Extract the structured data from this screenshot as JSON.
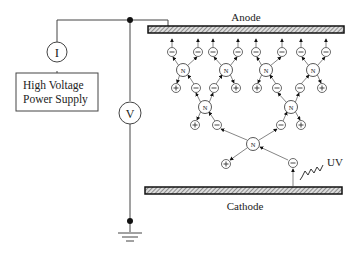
{
  "diagram": {
    "labels": {
      "anode": "Anode",
      "cathode": "Cathode",
      "uv": "UV",
      "power_supply_line1": "High Voltage",
      "power_supply_line2": "Power Supply",
      "ammeter": "I",
      "voltmeter": "V",
      "neutral": "N",
      "negative": "−",
      "positive": "+"
    },
    "colors": {
      "line": "#333333",
      "electrode_fill": "#999999",
      "background": "#ffffff"
    }
  }
}
